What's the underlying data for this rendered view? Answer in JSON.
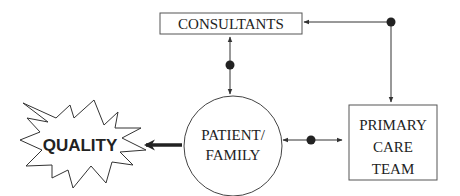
{
  "diagram": {
    "type": "flow",
    "nodes": [
      {
        "id": "consultants",
        "label": "CONSULTANTS",
        "shape": "rectangle"
      },
      {
        "id": "patient_family",
        "label_lines": [
          "PATIENT/",
          "FAMILY"
        ],
        "shape": "circle"
      },
      {
        "id": "primary_care_team",
        "label_lines": [
          "PRIMARY",
          "CARE",
          "TEAM"
        ],
        "shape": "rectangle"
      },
      {
        "id": "quality",
        "label": "QUALITY",
        "shape": "starburst"
      }
    ],
    "edges": [
      {
        "from": "consultants",
        "to": "patient_family",
        "direction": "bidirectional",
        "junction_dot": true
      },
      {
        "from": "patient_family",
        "to": "primary_care_team",
        "direction": "bidirectional",
        "junction_dot": true
      },
      {
        "from": "junction_top_right",
        "to": "consultants",
        "direction": "forward"
      },
      {
        "from": "junction_top_right",
        "to": "primary_care_team",
        "direction": "forward"
      },
      {
        "from": "patient_family",
        "to": "quality",
        "direction": "forward",
        "style": "thick"
      }
    ],
    "colors": {
      "stroke": "#333333",
      "text": "#222222",
      "background": "#ffffff"
    }
  },
  "labels": {
    "consultants": "CONSULTANTS",
    "patient_line1": "PATIENT/",
    "patient_line2": "FAMILY",
    "team_line1": "PRIMARY",
    "team_line2": "CARE",
    "team_line3": "TEAM",
    "quality": "QUALITY"
  }
}
